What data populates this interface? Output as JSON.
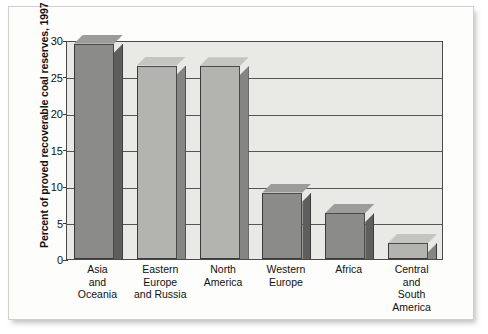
{
  "chart_data": {
    "type": "bar",
    "title": "",
    "subtitle": "",
    "xlabel": "",
    "ylabel": "Percent of proved recoverable coal reserves, 1997",
    "ylim": [
      0,
      30
    ],
    "yticks": [
      0,
      5,
      10,
      15,
      20,
      25,
      30
    ],
    "ytick_labels": [
      "0",
      "5",
      "10",
      "15",
      "20",
      "25",
      "30"
    ],
    "grid": true,
    "legend": "none",
    "categories": [
      "Asia and Oceania",
      "Eastern Europe and Russia",
      "North America",
      "Western Europe",
      "Africa",
      "Central and South America"
    ],
    "category_lines": [
      [
        "Asia",
        "and",
        "Oceania"
      ],
      [
        "Eastern",
        "Europe",
        "and Russia"
      ],
      [
        "North",
        "America"
      ],
      [
        "Western",
        "Europe"
      ],
      [
        "Africa"
      ],
      [
        "Central",
        "and",
        "South",
        "America"
      ]
    ],
    "values": [
      29.5,
      26.5,
      26.4,
      9.1,
      6.3,
      2.2
    ],
    "bar_shades": [
      "dark",
      "light",
      "light",
      "dark",
      "dark",
      "light"
    ],
    "style": "3d-shaded-bars"
  },
  "colors": {
    "plot_background": "#e9e9e6",
    "figure_background": "#fdfdfc",
    "axis_line": "#4a4a48",
    "gridline": "#555553",
    "bar_face_dark": "#8b8b89",
    "bar_side_dark": "#5e5e5c",
    "bar_top_dark": "#9c9c9a",
    "bar_face_light": "#b3b3b0",
    "bar_side_light": "#858583",
    "bar_top_light": "#c4c4c1",
    "text": "#111111"
  }
}
